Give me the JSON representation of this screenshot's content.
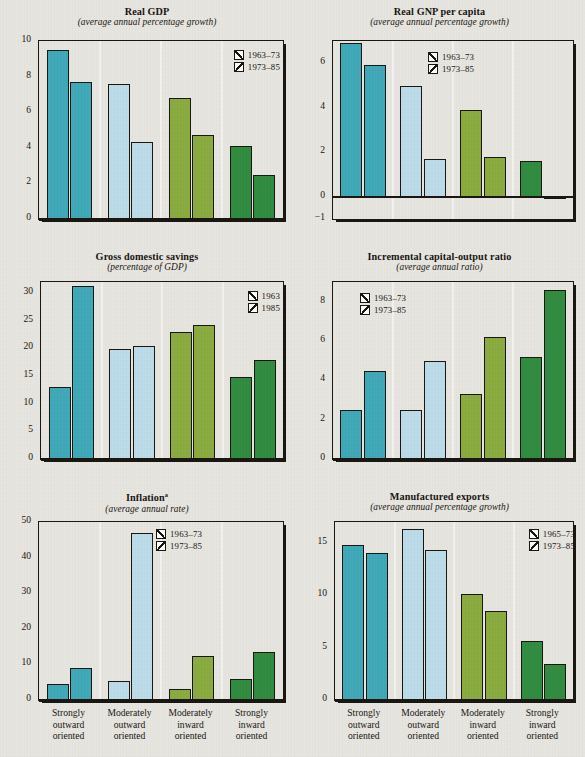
{
  "figure": {
    "categories": [
      "Strongly\noutward\noriented",
      "Moderately\noutward\noriented",
      "Moderately\ninward\noriented",
      "Strongly\ninward\noriented"
    ],
    "category_lines": [
      [
        "Strongly",
        "outward",
        "oriented"
      ],
      [
        "Moderately",
        "outward",
        "oriented"
      ],
      [
        "Moderately",
        "inward",
        "oriented"
      ],
      [
        "Strongly",
        "inward",
        "oriented"
      ]
    ],
    "group_colors": [
      "#3fa8b8",
      "#bcdcea",
      "#8aab3e",
      "#2f8b3f"
    ],
    "ink": "#17140f",
    "background": "#e8e6e0"
  },
  "chart_data": [
    {
      "id": "real-gdp",
      "type": "bar",
      "title": "Real GDP",
      "subtitle": "(average annual percentage growth)",
      "xlabel": "",
      "ylabel": "",
      "ylim": [
        0,
        10
      ],
      "yticks": [
        0,
        2,
        4,
        6,
        8,
        10
      ],
      "grid": false,
      "legend_position": "top-right",
      "categories": [
        "Strongly outward oriented",
        "Moderately outward oriented",
        "Moderately inward oriented",
        "Strongly inward oriented"
      ],
      "series": [
        {
          "name": "1963–73",
          "values": [
            9.5,
            7.6,
            6.8,
            4.1
          ]
        },
        {
          "name": "1973–85",
          "values": [
            7.7,
            4.3,
            4.7,
            2.5
          ]
        }
      ]
    },
    {
      "id": "real-gnp-per-capita",
      "type": "bar",
      "title": "Real GNP per capita",
      "subtitle": "(average annual percentage growth)",
      "xlabel": "",
      "ylabel": "",
      "ylim": [
        -1,
        7
      ],
      "yticks": [
        -1,
        0,
        2,
        4,
        6
      ],
      "grid": false,
      "legend_position": "top-center",
      "categories": [
        "Strongly outward oriented",
        "Moderately outward oriented",
        "Moderately inward oriented",
        "Strongly inward oriented"
      ],
      "series": [
        {
          "name": "1963–73",
          "values": [
            6.9,
            5.0,
            3.9,
            1.6
          ]
        },
        {
          "name": "1973–85",
          "values": [
            5.9,
            1.7,
            1.8,
            -0.1
          ]
        }
      ]
    },
    {
      "id": "gross-domestic-savings",
      "type": "bar",
      "title": "Gross domestic savings",
      "subtitle": "(percentage of GDP)",
      "xlabel": "",
      "ylabel": "",
      "ylim": [
        0,
        32
      ],
      "yticks": [
        0,
        5,
        10,
        15,
        20,
        25,
        30
      ],
      "grid": false,
      "legend_position": "top-right",
      "categories": [
        "Strongly outward oriented",
        "Moderately outward oriented",
        "Moderately inward oriented",
        "Strongly inward oriented"
      ],
      "series": [
        {
          "name": "1963",
          "values": [
            13.1,
            19.9,
            22.9,
            14.9
          ]
        },
        {
          "name": "1985",
          "values": [
            31.3,
            20.4,
            24.2,
            17.9
          ]
        }
      ]
    },
    {
      "id": "incremental-capital-output-ratio",
      "type": "bar",
      "title": "Incremental capital-output ratio",
      "subtitle": "(average annual ratio)",
      "xlabel": "",
      "ylabel": "",
      "ylim": [
        0,
        9
      ],
      "yticks": [
        0,
        2,
        4,
        6,
        8
      ],
      "grid": false,
      "legend_position": "top-left",
      "categories": [
        "Strongly outward oriented",
        "Moderately outward oriented",
        "Moderately inward oriented",
        "Strongly inward oriented"
      ],
      "series": [
        {
          "name": "1963–73",
          "values": [
            2.5,
            2.5,
            3.3,
            5.2
          ]
        },
        {
          "name": "1973–85",
          "values": [
            4.5,
            5.0,
            6.2,
            8.6
          ]
        }
      ]
    },
    {
      "id": "inflation",
      "type": "bar",
      "title": "Inflation",
      "title_superscript": "a",
      "subtitle": "(average annual rate)",
      "xlabel": "",
      "ylabel": "",
      "ylim": [
        0,
        50
      ],
      "yticks": [
        0,
        10,
        20,
        30,
        40,
        50
      ],
      "grid": false,
      "legend_position": "top-center",
      "categories": [
        "Strongly outward oriented",
        "Moderately outward oriented",
        "Moderately inward oriented",
        "Strongly inward oriented"
      ],
      "series": [
        {
          "name": "1963–73",
          "values": [
            4.6,
            5.2,
            3.0,
            6.0
          ]
        },
        {
          "name": "1973–85",
          "values": [
            9.0,
            47.0,
            12.3,
            13.4
          ]
        }
      ]
    },
    {
      "id": "manufactured-exports",
      "type": "bar",
      "title": "Manufactured exports",
      "subtitle": "(average annual percentage growth)",
      "xlabel": "",
      "ylabel": "",
      "ylim": [
        0,
        17
      ],
      "yticks": [
        0,
        5,
        10,
        15
      ],
      "grid": false,
      "legend_position": "top-right",
      "categories": [
        "Strongly outward oriented",
        "Moderately outward oriented",
        "Moderately inward oriented",
        "Strongly inward oriented"
      ],
      "series": [
        {
          "name": "1965–73",
          "values": [
            14.8,
            16.3,
            10.1,
            5.6
          ]
        },
        {
          "name": "1973–85",
          "values": [
            14.0,
            14.3,
            8.5,
            3.4
          ]
        }
      ]
    }
  ]
}
